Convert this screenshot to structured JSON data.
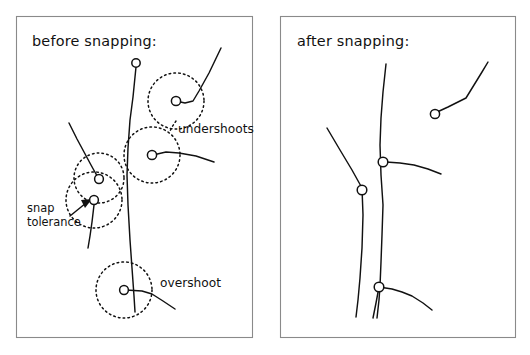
{
  "figure": {
    "name": "snapping-illustration",
    "background_color": "#ffffff",
    "ink_color": "#111111",
    "frame_color": "#8a8a8a",
    "width": 530,
    "height": 355
  },
  "panels": [
    {
      "id": "before",
      "title": "before snapping:",
      "frame": {
        "x": 16,
        "y": 16,
        "w": 236,
        "h": 321
      },
      "title_pos": {
        "x": 32,
        "y": 46
      }
    },
    {
      "id": "after",
      "title": "after snapping:",
      "frame": {
        "x": 280,
        "y": 16,
        "w": 235,
        "h": 321
      },
      "title_pos": {
        "x": 297,
        "y": 46
      }
    }
  ],
  "annotations": [
    {
      "id": "undershoots",
      "text": "undershoots",
      "x": 178,
      "y": 133,
      "anchor": "start"
    },
    {
      "id": "overshoot",
      "text": "overshoot",
      "x": 160,
      "y": 287,
      "anchor": "start"
    },
    {
      "id": "snap-tolerance-line-1",
      "text": "snap",
      "x": 27,
      "y": 212,
      "anchor": "start"
    },
    {
      "id": "snap-tolerance-line-2",
      "text": "tolerance",
      "x": 27,
      "y": 225,
      "anchor": "start"
    }
  ],
  "before_panel_geometry": {
    "polylines": [
      {
        "name": "long-vertical-backbone",
        "points": "136,67 133,97 130,120 128,148 127,175 128,205 130,240 132,268 134,296 135,312"
      },
      {
        "name": "upper-right-branch-to-undershoot-node",
        "points": "153,155 166,152 179,153 196,156 214,162"
      },
      {
        "name": "top-right-diagonal-branch",
        "points": "221,48 209,73 199,91 193,101 185,103 176,101"
      },
      {
        "name": "upper-left-curve-to-node",
        "points": "69,123 77,139 84,152 91,165 96,174 99,178"
      },
      {
        "name": "snap-tolerance-node-tail",
        "points": "94,205 92,222 90,236 88,248"
      },
      {
        "name": "overshoot-crossing-branch",
        "points": "126,290 142,291 152,294 163,301 175,309"
      },
      {
        "name": "undershoot-node-short-stub",
        "points": "136,67 136,62"
      }
    ],
    "dotted_circles": [
      {
        "name": "tolerance-circle-undershoot-upper",
        "cx": 176,
        "cy": 101,
        "r": 28
      },
      {
        "name": "tolerance-circle-undershoot-lower",
        "cx": 152,
        "cy": 155,
        "r": 28
      },
      {
        "name": "tolerance-circle-snap-upper",
        "cx": 99,
        "cy": 178,
        "r": 25
      },
      {
        "name": "tolerance-circle-snap-lower",
        "cx": 94,
        "cy": 200,
        "r": 28
      },
      {
        "name": "tolerance-circle-overshoot",
        "cx": 124,
        "cy": 290,
        "r": 28
      }
    ],
    "nodes": [
      {
        "name": "node-top-open-end",
        "cx": 136,
        "cy": 63,
        "r": 4.2
      },
      {
        "name": "node-undershoot-upper",
        "cx": 176,
        "cy": 101,
        "r": 4.6
      },
      {
        "name": "node-undershoot-lower",
        "cx": 152,
        "cy": 155,
        "r": 4.6
      },
      {
        "name": "node-snap-upper",
        "cx": 99,
        "cy": 179,
        "r": 4.4
      },
      {
        "name": "node-snap-lower",
        "cx": 94,
        "cy": 200,
        "r": 4.4
      },
      {
        "name": "node-overshoot",
        "cx": 124,
        "cy": 290,
        "r": 4.4
      }
    ],
    "arrow": {
      "name": "snap-tolerance-arrow",
      "shaft": "70,216 86,203",
      "head": "92,199 81,200 85,208"
    },
    "leader": {
      "name": "undershoots-leader",
      "points": "176,121 172,127 170,131"
    }
  },
  "after_panel_geometry": {
    "polylines": [
      {
        "name": "snapped-vertical-backbone",
        "points": "386,64 383,92 381,118 380,145 381,175 383,205 382,235 381,262 380,286 379,300 377,318"
      },
      {
        "name": "snapped-left-diagonal",
        "points": "327,128 340,150 352,170 362,188 363,215 362,248 360,278 358,300 356,317"
      },
      {
        "name": "snapped-upper-right-branch",
        "points": "435,113 448,107 458,102 466,98 474,85 482,72 488,62"
      },
      {
        "name": "snapped-mid-right-branch",
        "points": "386,162 400,163 414,165 428,169 441,174"
      },
      {
        "name": "snapped-lower-right-branch",
        "points": "379,287 392,289 402,292 412,296 423,303 432,310"
      },
      {
        "name": "snapped-lower-tail",
        "points": "379,287 376,303 373,318"
      }
    ],
    "nodes": [
      {
        "name": "node-snapped-upper-right",
        "cx": 435,
        "cy": 114,
        "r": 4.6
      },
      {
        "name": "node-snapped-mid-junction",
        "cx": 383,
        "cy": 162,
        "r": 4.8
      },
      {
        "name": "node-snapped-left-bend",
        "cx": 362,
        "cy": 190,
        "r": 4.8
      },
      {
        "name": "node-snapped-lower-junction",
        "cx": 379,
        "cy": 287,
        "r": 4.8
      }
    ]
  }
}
